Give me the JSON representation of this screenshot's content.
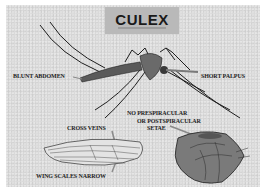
{
  "diagram": {
    "title": "CULEX",
    "labels": {
      "blunt_abdomen": "BLUNT ABDOMEN",
      "short_palpus": "SHORT PALPUS",
      "no_setae_line1": "NO PRESPIRACULAR",
      "no_setae_line2": "OR POSTSPIRACULAR",
      "no_setae_line3": "SETAE",
      "cross_veins": "CROSS VEINS",
      "wing_scales": "WING SCALES NARROW"
    },
    "colors": {
      "background": "#d9d9d9",
      "title_box": "#b9b9b9",
      "ink": "#1c1c1c",
      "pointer": "#8a8a8a"
    }
  }
}
